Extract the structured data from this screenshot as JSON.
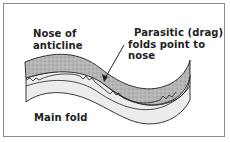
{
  "diagram": {
    "labels": {
      "nose_line1": "Nose of",
      "nose_line2": "anticline",
      "parasitic_line1": "Parasitic  (drag)",
      "parasitic_line2": "folds point to nose",
      "main_fold": "Main fold"
    },
    "colors": {
      "frame": "#8a8a8a",
      "upper_layer": "#b8b8b8",
      "lower_layer": "#ececec",
      "stroke": "#222222"
    }
  }
}
